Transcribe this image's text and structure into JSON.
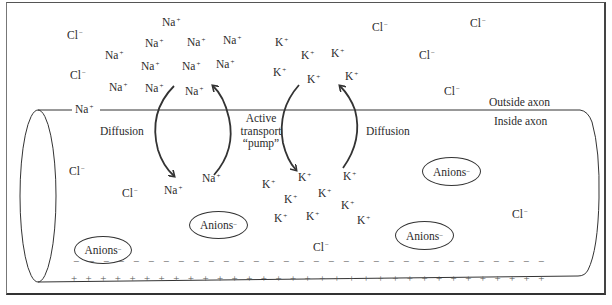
{
  "diagram": {
    "type": "axon-membrane-ion-distribution",
    "region_labels": {
      "outside": "Outside axon",
      "inside": "Inside axon"
    },
    "process_labels": {
      "diffusion_left": "Diffusion",
      "active_transport_line1": "Active",
      "active_transport_line2": "transport",
      "active_transport_line3": "“pump”",
      "diffusion_right": "Diffusion"
    },
    "ion_symbols": {
      "na": "Na",
      "k": "K",
      "cl": "Cl",
      "plus": "+",
      "minus": "−"
    },
    "anion_label": "Anions",
    "outside_ions": [
      {
        "ion": "Cl",
        "charge": "−",
        "x": 67,
        "y": 30
      },
      {
        "ion": "Cl",
        "charge": "−",
        "x": 70,
        "y": 70
      },
      {
        "ion": "Na",
        "charge": "+",
        "x": 162,
        "y": 17
      },
      {
        "ion": "Na",
        "charge": "+",
        "x": 105,
        "y": 50
      },
      {
        "ion": "Na",
        "charge": "+",
        "x": 145,
        "y": 38
      },
      {
        "ion": "Na",
        "charge": "+",
        "x": 187,
        "y": 37
      },
      {
        "ion": "Na",
        "charge": "+",
        "x": 223,
        "y": 35
      },
      {
        "ion": "Na",
        "charge": "+",
        "x": 141,
        "y": 61
      },
      {
        "ion": "Na",
        "charge": "+",
        "x": 182,
        "y": 61
      },
      {
        "ion": "Na",
        "charge": "+",
        "x": 216,
        "y": 59
      },
      {
        "ion": "Na",
        "charge": "+",
        "x": 109,
        "y": 82
      },
      {
        "ion": "Na",
        "charge": "+",
        "x": 145,
        "y": 83
      },
      {
        "ion": "Na",
        "charge": "+",
        "x": 185,
        "y": 86
      },
      {
        "ion": "K",
        "charge": "+",
        "x": 275,
        "y": 37
      },
      {
        "ion": "K",
        "charge": "+",
        "x": 301,
        "y": 50
      },
      {
        "ion": "K",
        "charge": "+",
        "x": 331,
        "y": 48
      },
      {
        "ion": "K",
        "charge": "+",
        "x": 273,
        "y": 67
      },
      {
        "ion": "K",
        "charge": "+",
        "x": 307,
        "y": 74
      },
      {
        "ion": "K",
        "charge": "+",
        "x": 345,
        "y": 71
      },
      {
        "ion": "Cl",
        "charge": "−",
        "x": 372,
        "y": 22
      },
      {
        "ion": "Cl",
        "charge": "−",
        "x": 470,
        "y": 18
      },
      {
        "ion": "Cl",
        "charge": "−",
        "x": 419,
        "y": 50
      },
      {
        "ion": "Cl",
        "charge": "−",
        "x": 444,
        "y": 86
      }
    ],
    "membrane_ion": {
      "ion": "Na",
      "charge": "+",
      "x": 75,
      "y": 104
    },
    "inside_ions": [
      {
        "ion": "Cl",
        "charge": "−",
        "x": 69,
        "y": 166
      },
      {
        "ion": "Cl",
        "charge": "−",
        "x": 122,
        "y": 188
      },
      {
        "ion": "Na",
        "charge": "+",
        "x": 164,
        "y": 185
      },
      {
        "ion": "Na",
        "charge": "+",
        "x": 202,
        "y": 173
      },
      {
        "ion": "K",
        "charge": "+",
        "x": 262,
        "y": 179
      },
      {
        "ion": "K",
        "charge": "+",
        "x": 298,
        "y": 172
      },
      {
        "ion": "K",
        "charge": "+",
        "x": 343,
        "y": 171
      },
      {
        "ion": "K",
        "charge": "+",
        "x": 284,
        "y": 194
      },
      {
        "ion": "K",
        "charge": "+",
        "x": 318,
        "y": 188
      },
      {
        "ion": "K",
        "charge": "+",
        "x": 341,
        "y": 200
      },
      {
        "ion": "K",
        "charge": "+",
        "x": 274,
        "y": 213
      },
      {
        "ion": "K",
        "charge": "+",
        "x": 306,
        "y": 211
      },
      {
        "ion": "K",
        "charge": "+",
        "x": 357,
        "y": 215
      },
      {
        "ion": "Cl",
        "charge": "−",
        "x": 313,
        "y": 242
      },
      {
        "ion": "Cl",
        "charge": "−",
        "x": 512,
        "y": 209
      }
    ],
    "anions": [
      {
        "x": 74,
        "y": 236,
        "w": 58,
        "h": 28
      },
      {
        "x": 189,
        "y": 211,
        "w": 59,
        "h": 28
      },
      {
        "x": 422,
        "y": 157,
        "w": 59,
        "h": 29
      },
      {
        "x": 395,
        "y": 221,
        "w": 59,
        "h": 29
      }
    ],
    "membrane_inner_charge": {
      "symbol": "−",
      "count": 32
    },
    "membrane_outer_charge": {
      "symbol": "+",
      "count": 33
    }
  }
}
